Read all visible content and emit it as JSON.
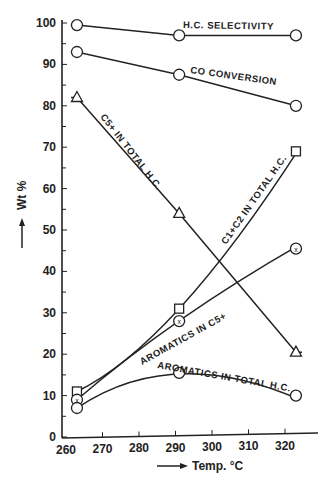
{
  "chart_data": {
    "type": "line",
    "title": "",
    "xlabel": "Temp. °C",
    "ylabel": "Wt %",
    "xlim": [
      260,
      328
    ],
    "ylim": [
      0,
      100
    ],
    "x_ticks": [
      260,
      270,
      280,
      290,
      300,
      310,
      320
    ],
    "y_ticks": [
      0,
      10,
      20,
      30,
      40,
      50,
      60,
      70,
      80,
      90,
      100
    ],
    "grid": false,
    "legend": "inline labels",
    "x": [
      263,
      291,
      323
    ],
    "series": [
      {
        "name": "H.C. SELECTIVITY",
        "marker": "circle",
        "values": [
          99.5,
          97,
          97
        ]
      },
      {
        "name": "CO CONVERSION",
        "marker": "circle",
        "values": [
          93,
          87.5,
          80
        ]
      },
      {
        "name": "C5+ IN TOTAL H.C.",
        "marker": "triangle",
        "values": [
          82,
          54,
          20.5
        ]
      },
      {
        "name": "C1+C2 IN TOTAL H.C.",
        "marker": "square",
        "values": [
          11,
          31,
          69
        ]
      },
      {
        "name": "AROMATICS IN C5+",
        "marker": "circle-x",
        "values": [
          9,
          28,
          45.5
        ]
      },
      {
        "name": "AROMATICS IN TOTAL H.C.",
        "marker": "circle",
        "values": [
          7,
          15.5,
          10
        ]
      }
    ]
  },
  "labels": {
    "hc": "H.C. SELECTIVITY",
    "co": "CO CONVERSION",
    "c5": "C5+ IN TOTAL H.C.",
    "c12": "C1+C2 IN TOTAL H.C.",
    "aro5": "AROMATICS IN C5+",
    "arot": "AROMATICS IN TOTAL H.C.",
    "xlabel": "Temp. °C",
    "ylabel": "Wt %"
  }
}
